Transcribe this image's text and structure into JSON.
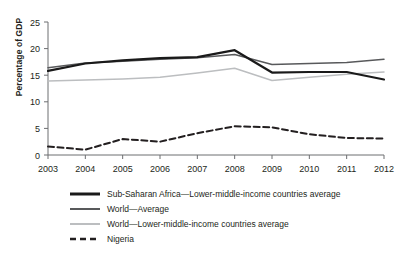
{
  "chart_data": {
    "type": "line",
    "title": "",
    "xlabel": "",
    "ylabel": "Percentage of GDP",
    "x": [
      2003,
      2004,
      2005,
      2006,
      2007,
      2008,
      2009,
      2010,
      2011,
      2012
    ],
    "xticklabels": [
      "2003",
      "2004",
      "2005",
      "2006",
      "2007",
      "2008",
      "2009",
      "2010",
      "2011",
      "2012"
    ],
    "yticklabels": [
      "0",
      "5",
      "10",
      "15",
      "20",
      "25"
    ],
    "yticks": [
      0,
      5,
      10,
      15,
      20,
      25
    ],
    "ylim": [
      0,
      25
    ],
    "xlim": [
      2003,
      2012
    ],
    "grid": false,
    "legend_position": "below",
    "series": [
      {
        "name": "Sub-Saharan Africa—Lower-middle-income countries average",
        "color": "#1a1a1a",
        "width": 2.2,
        "dash": "solid",
        "values": [
          15.8,
          17.2,
          17.8,
          18.2,
          18.4,
          19.7,
          15.5,
          15.6,
          15.6,
          14.2
        ]
      },
      {
        "name": "World—Average",
        "color": "#58595b",
        "width": 1.5,
        "dash": "solid",
        "values": [
          16.4,
          17.3,
          17.6,
          18.0,
          18.3,
          18.9,
          17.0,
          17.2,
          17.4,
          18.0
        ]
      },
      {
        "name": "World—Lower-middle-income countries average",
        "color": "#bcbec0",
        "width": 1.5,
        "dash": "solid",
        "values": [
          13.9,
          14.1,
          14.3,
          14.6,
          15.4,
          16.3,
          14.0,
          14.6,
          15.2,
          15.6
        ]
      },
      {
        "name": "Nigeria",
        "color": "#231f20",
        "width": 2.0,
        "dash": "dashed",
        "values": [
          1.6,
          1.0,
          3.0,
          2.5,
          4.1,
          5.4,
          5.2,
          3.9,
          3.2,
          3.1
        ]
      }
    ]
  },
  "legend": {
    "items": [
      {
        "label": "Sub-Saharan Africa—Lower-middle-income countries average",
        "swatch": "thick-black-line-icon"
      },
      {
        "label": "World—Average",
        "swatch": "medium-gray-line-icon"
      },
      {
        "label": "World—Lower-middle-income countries average",
        "swatch": "light-gray-line-icon"
      },
      {
        "label": "Nigeria",
        "swatch": "black-dashed-line-icon"
      }
    ]
  }
}
